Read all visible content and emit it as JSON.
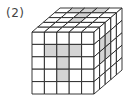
{
  "label": "(2)",
  "cube": {
    "grid_size": 5,
    "front_origin": [
      32,
      32
    ],
    "cell": 12.4,
    "depth_offset": [
      28,
      -24
    ],
    "line_color": "#222222",
    "shade_color": "#d4d4d4",
    "front_shaded": [
      [
        1,
        1
      ],
      [
        1,
        2
      ],
      [
        1,
        3
      ],
      [
        2,
        2
      ],
      [
        3,
        2
      ]
    ],
    "top_shaded": [
      [
        0,
        1
      ],
      [
        0,
        2
      ],
      [
        0,
        3
      ],
      [
        1,
        2
      ],
      [
        2,
        2
      ]
    ],
    "right_shaded": [
      [
        1,
        1
      ],
      [
        2,
        1
      ],
      [
        1,
        2
      ],
      [
        2,
        2
      ]
    ]
  }
}
